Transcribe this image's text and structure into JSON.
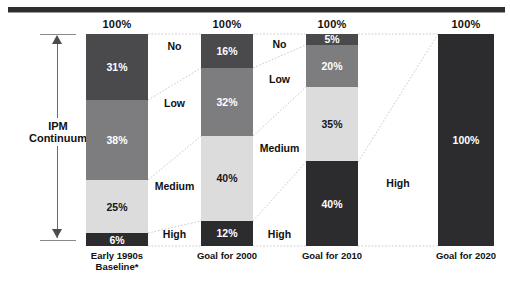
{
  "chart_data": {
    "type": "bar",
    "title": "",
    "subtitle": "",
    "xlabel": "",
    "ylabel": "IPM Continuum",
    "ylim": [
      0,
      100
    ],
    "grid": false,
    "legend_position": "between-columns",
    "stacked": true,
    "units": "percent",
    "categories": [
      "Early 1990s Baseline*",
      "Goal for 2000",
      "Goal for 2010",
      "Goal for 2020"
    ],
    "series": [
      {
        "name": "No",
        "color": "#4a4a4d",
        "values": [
          31,
          16,
          5,
          0
        ]
      },
      {
        "name": "Low",
        "color": "#7d7d80",
        "values": [
          38,
          32,
          20,
          0
        ]
      },
      {
        "name": "Medium",
        "color": "#dcdcdc",
        "values": [
          25,
          40,
          35,
          0
        ]
      },
      {
        "name": "High",
        "color": "#2c2c2f",
        "values": [
          6,
          12,
          40,
          100
        ]
      }
    ],
    "column_totals": [
      "100%",
      "100%",
      "100%",
      "100%"
    ]
  },
  "axis": {
    "label_line1": "IPM",
    "label_line2": "Continuum",
    "arrow_top": "up-arrowhead",
    "arrow_bottom": "down-arrowhead"
  },
  "columns": [
    {
      "total": "100%",
      "label_line1": "Early 1990s",
      "label_line2": "Baseline*",
      "segments": [
        {
          "key": "no",
          "label": "31%",
          "value": 31
        },
        {
          "key": "low",
          "label": "38%",
          "value": 38
        },
        {
          "key": "medium",
          "label": "25%",
          "value": 25
        },
        {
          "key": "high",
          "label": "6%",
          "value": 6
        }
      ]
    },
    {
      "total": "100%",
      "label_line1": "Goal for 2000",
      "label_line2": "",
      "segments": [
        {
          "key": "no",
          "label": "16%",
          "value": 16
        },
        {
          "key": "low",
          "label": "32%",
          "value": 32
        },
        {
          "key": "medium",
          "label": "40%",
          "value": 40
        },
        {
          "key": "high",
          "label": "12%",
          "value": 12
        }
      ]
    },
    {
      "total": "100%",
      "label_line1": "Goal for 2010",
      "label_line2": "",
      "segments": [
        {
          "key": "no",
          "label": "5%",
          "value": 5
        },
        {
          "key": "low",
          "label": "20%",
          "value": 20
        },
        {
          "key": "medium",
          "label": "35%",
          "value": 35
        },
        {
          "key": "high",
          "label": "40%",
          "value": 40
        }
      ]
    },
    {
      "total": "100%",
      "label_line1": "Goal for 2020",
      "label_line2": "",
      "segments": [
        {
          "key": "high",
          "label": "100%",
          "value": 100
        }
      ]
    }
  ],
  "gutters": [
    {
      "labels": [
        {
          "name": "No",
          "text": "No",
          "top": 40
        },
        {
          "name": "Low",
          "text": "Low",
          "top": 97
        },
        {
          "name": "Medium",
          "text": "Medium",
          "top": 180
        },
        {
          "name": "High",
          "text": "High",
          "top": 228
        }
      ]
    },
    {
      "labels": [
        {
          "name": "No",
          "text": "No",
          "top": 38
        },
        {
          "name": "Low",
          "text": "Low",
          "top": 73
        },
        {
          "name": "Medium",
          "text": "Medium",
          "top": 142
        },
        {
          "name": "High",
          "text": "High",
          "top": 228
        }
      ]
    },
    {
      "labels": [
        {
          "name": "High",
          "text": "High",
          "top": 177
        }
      ]
    }
  ],
  "palette": {
    "no": "#4a4a4d",
    "low": "#7d7d80",
    "medium": "#dcdcdc",
    "high": "#2c2c2f",
    "rule": "#2e2e31",
    "connector": "#c9c9c9",
    "text": "#111111"
  }
}
